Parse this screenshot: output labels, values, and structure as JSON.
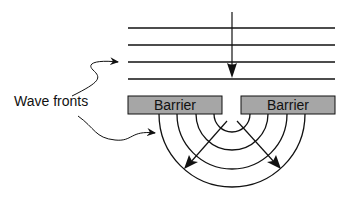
{
  "diagram": {
    "labels": {
      "wave_fronts": "Wave fronts",
      "barrier_left": "Barrier",
      "barrier_right": "Barrier"
    },
    "colors": {
      "barrier_fill": "#a6a6a6",
      "stroke": "#111111",
      "background": "#ffffff"
    },
    "incoming_wavefront_lines": 4,
    "diffracted_arcs": 4
  }
}
